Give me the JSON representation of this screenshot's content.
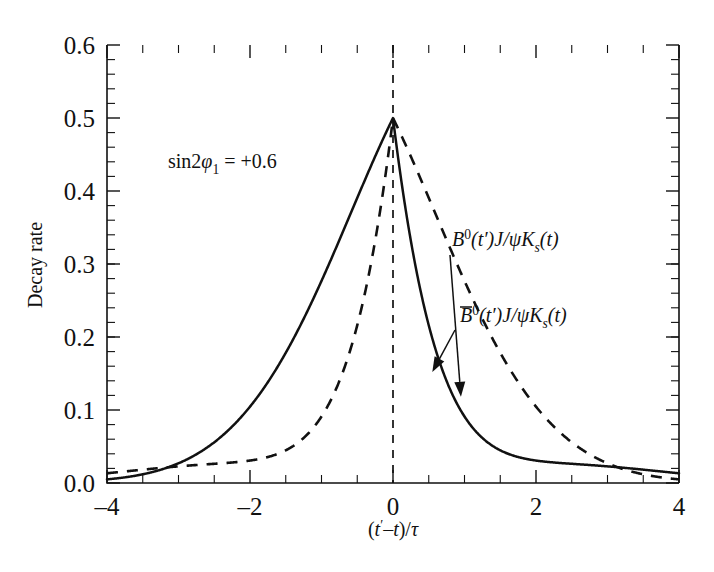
{
  "chart_data": {
    "type": "line",
    "title": "",
    "xlabel": "(t'-t)/τ",
    "ylabel": "Decay rate",
    "xlim": [
      -4,
      4
    ],
    "ylim": [
      0,
      0.6
    ],
    "grid": false,
    "legend_position": "inline-annotations",
    "annotation": "sin2φ₁ = +0.6",
    "annotation_parts": {
      "prefix": "sin2",
      "symbol": "φ",
      "subscript": "1",
      "equals": " = +0.6"
    },
    "xticks": [
      -4,
      -2,
      0,
      2,
      4
    ],
    "xtick_labels": [
      "-4",
      "-2",
      "0",
      "2",
      "4"
    ],
    "yticks": [
      0.0,
      0.1,
      0.2,
      0.3,
      0.4,
      0.5,
      0.6
    ],
    "ytick_labels": [
      "0.0",
      "0.1",
      "0.2",
      "0.3",
      "0.4",
      "0.5",
      "0.6"
    ],
    "x_minor_per_major": 4,
    "y_minor_per_major": 5,
    "vertical_reference_line": {
      "x": 0,
      "style": "dashed"
    },
    "formula_note": "rate = 0.5 * exp(-|x|) * (1 -/+ 0.6*sin(x))",
    "amplitude": 0.5,
    "sin2phi1": 0.6,
    "series": [
      {
        "name": "B0(t')J/psiKs(t)",
        "style": "solid",
        "sign": -1,
        "label_parts": {
          "b": "B",
          "sup": "0",
          "arg": "(t′)",
          "rest": "J/ψK",
          "sub": "s",
          "tail": "(t)"
        },
        "x": [
          -4,
          -3.5,
          -3,
          -2.5,
          -2,
          -1.5,
          -1,
          -0.5,
          -0.25,
          0,
          0.25,
          0.5,
          1,
          1.5,
          2,
          2.5,
          3,
          3.5,
          4
        ],
        "values": [
          0.0132,
          0.0213,
          0.0283,
          0.0369,
          0.0492,
          0.0782,
          0.1465,
          0.269,
          0.3511,
          0.5,
          0.3593,
          0.2145,
          0.1029,
          0.0445,
          0.0185,
          0.0087,
          0.0054,
          0.0047,
          0.0047
        ]
      },
      {
        "name": "B0bar(t')J/psiKs(t)",
        "style": "dashed",
        "sign": 1,
        "label_parts": {
          "b": "B",
          "sup": "0",
          "arg": "(t′)",
          "rest": "J/ψK",
          "sub": "s",
          "tail": "(t)",
          "overbar": true
        },
        "x": [
          -4,
          -3.5,
          -3,
          -2.5,
          -2,
          -1.5,
          -1,
          -0.5,
          -0.25,
          0,
          0.25,
          0.5,
          1,
          1.5,
          2,
          2.5,
          3,
          3.5,
          4
        ],
        "values": [
          0.0234,
          0.0391,
          0.0539,
          0.0726,
          0.1,
          0.1452,
          0.2304,
          0.3378,
          0.3836,
          0.5,
          0.3267,
          0.1825,
          0.0752,
          0.0224,
          0.0046,
          0.0023,
          0.0044,
          0.0057,
          0.0132
        ]
      }
    ],
    "annotations": [
      {
        "text": "B0(t')J/psiKs(t)",
        "arrow_to_x": 0.95,
        "arrow_to_y": 0.118
      },
      {
        "text": "B0bar(t')J/psiKs(t)",
        "arrow_to_x": 0.55,
        "arrow_to_y": 0.152
      }
    ]
  },
  "colors": {
    "background": "#ffffff",
    "ink": "#111111"
  }
}
